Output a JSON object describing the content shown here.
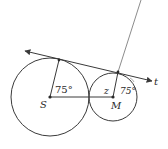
{
  "figure": {
    "labels": {
      "center_large": "S",
      "center_small": "M",
      "tangent_line": "t",
      "angle_at_S": "75°",
      "angle_z": "z",
      "angle_at_M": "75°"
    },
    "colors": {
      "stroke": "#3a3a3a",
      "secant": "#8c8c8c",
      "background": "#ffffff"
    }
  }
}
